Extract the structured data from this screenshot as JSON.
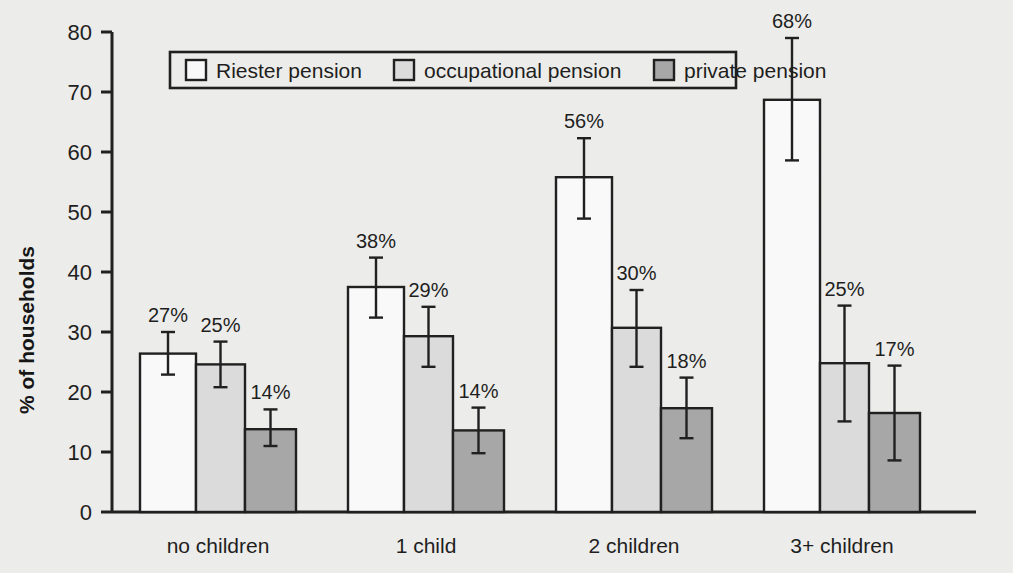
{
  "chart_data": {
    "type": "bar",
    "title": "",
    "xlabel": "",
    "ylabel": "% of households",
    "ylim": [
      0,
      80
    ],
    "ytick_step": 10,
    "yticks": [
      "0",
      "10",
      "20",
      "30",
      "40",
      "50",
      "60",
      "70",
      "80"
    ],
    "grid": false,
    "legend_position": "top-center",
    "categories": [
      "no children",
      "1 child",
      "2 children",
      "3+ children"
    ],
    "series": [
      {
        "name": "Riester pension",
        "color": "#ffffff",
        "values": [
          26.4,
          37.5,
          55.8,
          68.7
        ],
        "labels": [
          "27%",
          "38%",
          "56%",
          "68%"
        ],
        "err_low": [
          22.9,
          32.4,
          48.9,
          58.6
        ],
        "err_high": [
          30.0,
          42.4,
          62.3,
          79.0
        ]
      },
      {
        "name": "occupational pension",
        "color": "#e0e0e0",
        "values": [
          24.6,
          29.3,
          30.7,
          24.8
        ],
        "labels": [
          "25%",
          "29%",
          "30%",
          "25%"
        ],
        "err_low": [
          20.8,
          24.2,
          24.2,
          15.1
        ],
        "err_high": [
          28.4,
          34.2,
          37.0,
          34.4
        ]
      },
      {
        "name": "private pension",
        "color": "#a9a9a9",
        "values": [
          13.8,
          13.6,
          17.3,
          16.5
        ],
        "labels": [
          "14%",
          "14%",
          "18%",
          "17%"
        ],
        "err_low": [
          11.0,
          9.8,
          12.3,
          8.6
        ],
        "err_high": [
          17.1,
          17.4,
          22.4,
          24.4
        ]
      }
    ]
  },
  "legend": {
    "items": [
      {
        "label": "Riester pension",
        "swatch": "#ffffff"
      },
      {
        "label": "occupational pension",
        "swatch": "#e0e0e0"
      },
      {
        "label": "private pension",
        "swatch": "#a9a9a9"
      }
    ]
  },
  "axes": {
    "y_title": "% of households"
  }
}
